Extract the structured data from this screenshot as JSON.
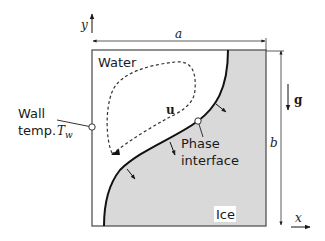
{
  "diagram": {
    "regions": {
      "water": "Water",
      "ice": "Ice"
    },
    "labels": {
      "wall_line1": "Wall",
      "wall_line2": "temp.",
      "wall_symbol": "T",
      "wall_subscript": "w",
      "velocity": "u",
      "interface_line1": "Phase",
      "interface_line2": "interface",
      "gravity": "g"
    },
    "axes": {
      "x": "x",
      "y": "y"
    },
    "dimensions": {
      "width": "a",
      "height": "b"
    },
    "colors": {
      "ice_fill": "#d9d9d9",
      "lines": "#1a1a1a",
      "box_border": "#555555"
    }
  }
}
